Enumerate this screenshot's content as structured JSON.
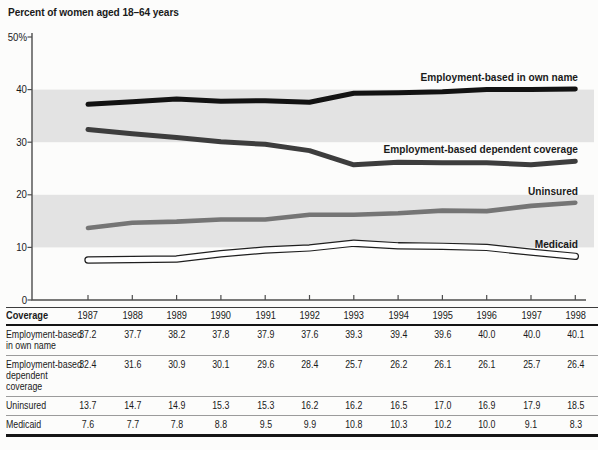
{
  "title": "Percent of women aged 18–64 years",
  "colors": {
    "background": "#fcfcfb",
    "band": "#e3e3e3",
    "axis": "#4d4d4d",
    "text": "#1a1a1a",
    "table_rule_light": "#9b9b9b",
    "table_rule_dark": "#141414"
  },
  "chart_data": {
    "type": "line",
    "title": "Percent of women aged 18–64 years",
    "x": [
      1987,
      1988,
      1989,
      1990,
      1991,
      1992,
      1993,
      1994,
      1995,
      1996,
      1997,
      1998
    ],
    "series": [
      {
        "id": "own-name",
        "name": "Employment-based in own name",
        "values": [
          37.2,
          37.7,
          38.2,
          37.8,
          37.9,
          37.6,
          39.3,
          39.4,
          39.6,
          40.0,
          40.0,
          40.1
        ],
        "color": "#121212",
        "width": 5
      },
      {
        "id": "dependent",
        "name": "Employment-based dependent coverage",
        "values": [
          32.4,
          31.6,
          30.9,
          30.1,
          29.6,
          28.4,
          25.7,
          26.2,
          26.1,
          26.1,
          25.7,
          26.4
        ],
        "color": "#3d3d3d",
        "width": 5
      },
      {
        "id": "uninsured",
        "name": "Uninsured",
        "values": [
          13.7,
          14.7,
          14.9,
          15.3,
          15.3,
          16.2,
          16.2,
          16.5,
          17.0,
          16.9,
          17.9,
          18.5
        ],
        "color": "#757575",
        "width": 4.6
      },
      {
        "id": "medicaid",
        "name": "Medicaid",
        "values": [
          7.6,
          7.7,
          7.8,
          8.8,
          9.5,
          9.9,
          10.8,
          10.3,
          10.2,
          10.0,
          9.1,
          8.3
        ],
        "color": "#ffffff",
        "outline": "#1f1f1f",
        "width": 5
      }
    ],
    "ylim": [
      0,
      50
    ],
    "yticks": [
      0,
      10,
      20,
      30,
      40,
      50
    ],
    "ytick_labels": [
      "0",
      "10",
      "20",
      "30",
      "40",
      "50%"
    ],
    "bands": [
      [
        10,
        20
      ],
      [
        30,
        40
      ]
    ],
    "grid": false,
    "legend": "inline-labels-right"
  },
  "table": {
    "header": [
      "Coverage",
      "1987",
      "1988",
      "1989",
      "1990",
      "1991",
      "1992",
      "1993",
      "1994",
      "1995",
      "1996",
      "1997",
      "1998"
    ],
    "rows": [
      {
        "label": "Employment-based in own name",
        "label_lines": [
          "Employment-based",
          "in own name"
        ],
        "values": [
          "37.2",
          "37.7",
          "38.2",
          "37.8",
          "37.9",
          "37.6",
          "39.3",
          "39.4",
          "39.6",
          "40.0",
          "40.0",
          "40.1"
        ]
      },
      {
        "label": "Employment-based dependent coverage",
        "label_lines": [
          "Employment-based",
          "dependent",
          "coverage"
        ],
        "values": [
          "32.4",
          "31.6",
          "30.9",
          "30.1",
          "29.6",
          "28.4",
          "25.7",
          "26.2",
          "26.1",
          "26.1",
          "25.7",
          "26.4"
        ]
      },
      {
        "label": "Uninsured",
        "label_lines": [
          "Uninsured"
        ],
        "values": [
          "13.7",
          "14.7",
          "14.9",
          "15.3",
          "15.3",
          "16.2",
          "16.2",
          "16.5",
          "17.0",
          "16.9",
          "17.9",
          "18.5"
        ]
      },
      {
        "label": "Medicaid",
        "label_lines": [
          "Medicaid"
        ],
        "values": [
          "7.6",
          "7.7",
          "7.8",
          "8.8",
          "9.5",
          "9.9",
          "10.8",
          "10.3",
          "10.2",
          "10.0",
          "9.1",
          "8.3"
        ]
      }
    ]
  }
}
